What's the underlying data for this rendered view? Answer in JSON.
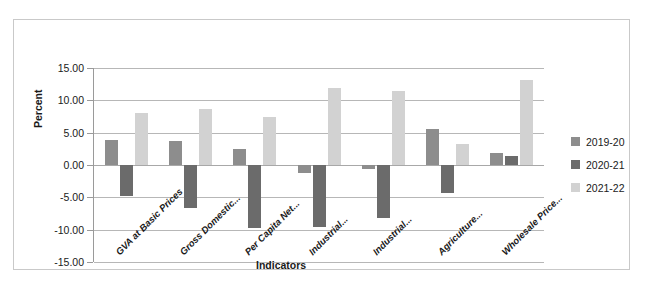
{
  "chart_data": {
    "type": "bar",
    "title": "",
    "xlabel": "Indicators",
    "ylabel": "Percent",
    "ylim": [
      -15.0,
      15.0
    ],
    "ytick_step": 5.0,
    "ytick_labels": [
      "15.00",
      "10.00",
      "5.00",
      "0.00",
      "-5.00",
      "-10.00",
      "-15.00"
    ],
    "ytick_values": [
      15.0,
      10.0,
      5.0,
      0.0,
      -5.0,
      -10.0,
      -15.0
    ],
    "grid": true,
    "legend_position": "right",
    "categories": [
      "GVA at Basic Prices",
      "Gross Domestic...",
      "Per Capita Net...",
      "Industrial...",
      "Industrial...",
      "Agriculture...",
      "Wholesale Price..."
    ],
    "series": [
      {
        "name": "2019-20",
        "color": "#8d8d8d",
        "values": [
          3.8,
          3.7,
          2.4,
          -1.2,
          -0.6,
          5.5,
          1.8
        ]
      },
      {
        "name": "2020-21",
        "color": "#6b6b6b",
        "values": [
          -4.8,
          -6.6,
          -9.7,
          -9.6,
          -8.2,
          -4.3,
          1.4
        ]
      },
      {
        "name": "2021-22",
        "color": "#d2d2d2",
        "values": [
          8.1,
          8.7,
          7.5,
          11.9,
          11.5,
          3.2,
          13.2
        ]
      }
    ]
  },
  "legend": {
    "items": [
      {
        "label": "2019-20",
        "color": "#8d8d8d"
      },
      {
        "label": "2020-21",
        "color": "#6b6b6b"
      },
      {
        "label": "2021-22",
        "color": "#d2d2d2"
      }
    ]
  },
  "axis": {
    "y_title": "Percent",
    "x_title": "Indicators"
  }
}
